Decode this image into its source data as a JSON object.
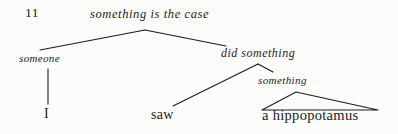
{
  "figure": {
    "number": "11",
    "type": "syntactic-tree-diagram",
    "ink_color": "#1b1b1b",
    "background_color": "#fcfcfb"
  },
  "nodes": {
    "root": {
      "label": "something is the case",
      "style": "italic"
    },
    "left_child": {
      "label": "someone",
      "style": "italic"
    },
    "right_child": {
      "label": "did something",
      "style": "italic"
    },
    "object_node": {
      "label": "something",
      "style": "italic"
    },
    "terminal_i": {
      "label": "I",
      "style": "upright"
    },
    "terminal_saw": {
      "label": "saw",
      "style": "upright"
    },
    "terminal_hippo": {
      "label": "a hippopotamus",
      "style": "upright"
    }
  },
  "edges": [
    {
      "name": "root-to-someone",
      "from": [
        145,
        30
      ],
      "to": [
        40,
        50
      ]
    },
    {
      "name": "root-to-did-something",
      "from": [
        145,
        30
      ],
      "to": [
        226,
        46
      ]
    },
    {
      "name": "someone-to-i",
      "from": [
        48,
        68
      ],
      "to": [
        48,
        103
      ]
    },
    {
      "name": "did-something-to-saw",
      "from": [
        258,
        64
      ],
      "to": [
        173,
        106
      ]
    },
    {
      "name": "did-something-to-something",
      "from": [
        258,
        64
      ],
      "to": [
        273,
        72
      ]
    },
    {
      "name": "triangle-left-leg",
      "from": [
        296,
        92
      ],
      "to": [
        262,
        110
      ]
    },
    {
      "name": "triangle-right-leg",
      "from": [
        296,
        92
      ],
      "to": [
        378,
        110
      ]
    },
    {
      "name": "triangle-base",
      "from": [
        262,
        110
      ],
      "to": [
        378,
        110
      ]
    }
  ]
}
